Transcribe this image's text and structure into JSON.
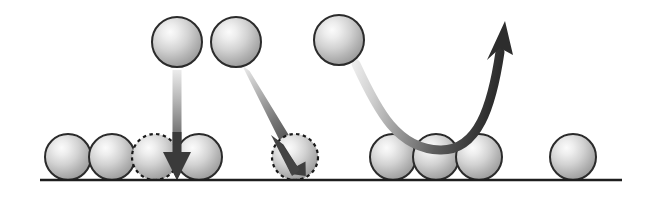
{
  "figure": {
    "type": "schematic-diagram",
    "width": 656,
    "height": 198,
    "background_color": "#ffffff"
  },
  "colors": {
    "sphere_fill_light": "#f2f2f2",
    "sphere_fill_mid": "#c9c9c9",
    "sphere_fill_dark": "#9a9a9a",
    "sphere_outline": "#2b2b2b",
    "dashed_outline": "#1a1a1a",
    "arrow_dark": "#3a3a3a",
    "arrow_light": "#e4e4e4",
    "baseline": "#1e1e1e"
  },
  "baseline": {
    "name": "substrate-surface-line",
    "x1": 40,
    "y1": 180,
    "x2": 622,
    "y2": 180,
    "stroke_width": 2.4
  },
  "incident_spheres": [
    {
      "label": "incident-atom-1",
      "cx": 177,
      "cy": 42,
      "r": 25,
      "style": "solid"
    },
    {
      "label": "incident-atom-2",
      "cx": 236,
      "cy": 42,
      "r": 25,
      "style": "solid"
    },
    {
      "label": "incident-atom-3",
      "cx": 339,
      "cy": 40,
      "r": 25,
      "style": "solid"
    }
  ],
  "surface_spheres": [
    {
      "label": "surface-atom-1",
      "cx": 68,
      "cy": 157,
      "r": 23,
      "style": "solid"
    },
    {
      "label": "surface-atom-2",
      "cx": 112,
      "cy": 157,
      "r": 23,
      "style": "solid"
    },
    {
      "label": "adsorption-site-1",
      "cx": 155,
      "cy": 157,
      "r": 23,
      "style": "dashed"
    },
    {
      "label": "surface-atom-3",
      "cx": 199,
      "cy": 157,
      "r": 23,
      "style": "solid"
    },
    {
      "label": "adsorption-site-2",
      "cx": 295,
      "cy": 157,
      "r": 23,
      "style": "dashed"
    },
    {
      "label": "surface-atom-4",
      "cx": 393,
      "cy": 157,
      "r": 23,
      "style": "solid"
    },
    {
      "label": "surface-atom-5",
      "cx": 436,
      "cy": 157,
      "r": 23,
      "style": "solid"
    },
    {
      "label": "surface-atom-6",
      "cx": 479,
      "cy": 157,
      "r": 23,
      "style": "solid"
    },
    {
      "label": "surface-atom-7",
      "cx": 573,
      "cy": 157,
      "r": 23,
      "style": "solid"
    }
  ],
  "arrows": [
    {
      "label": "vertical-deposition-arrow",
      "kind": "straight",
      "path": "M 177 72 L 177 158",
      "shaft_width": 9,
      "head_width": 28,
      "head_length": 30,
      "head_tip": {
        "x": 177,
        "y": 180
      },
      "head_angle_deg": 90,
      "gradient_from": "#e8e8e8",
      "gradient_to": "#383838",
      "description": "atom falls straight down into vacant adsorption site"
    },
    {
      "label": "diagonal-deposition-arrow",
      "kind": "straight",
      "path": "M 247 70 L 296 155",
      "shaft_width": 9,
      "head_width": 26,
      "head_length": 28,
      "head_tip": {
        "x": 305,
        "y": 172
      },
      "head_angle_deg": 60,
      "gradient_from": "#e8e8e8",
      "gradient_to": "#3c3c3c",
      "description": "atom arrives at an angle into vacant adsorption site"
    },
    {
      "label": "reflection-curved-arrow",
      "kind": "curved",
      "path": "M 357 63 C 381 110, 400 146, 440 147 C 474 148, 488 110, 497 62",
      "shaft_width": 9,
      "head_tip": {
        "x": 503,
        "y": 28
      },
      "head_angle_deg": -72,
      "gradient_from": "#e9e9e9",
      "gradient_to": "#2f2f2f",
      "description": "atom scatters off the surface and is reflected upward"
    }
  ]
}
